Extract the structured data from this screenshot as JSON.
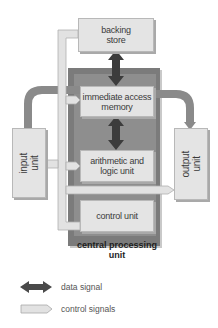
{
  "diagram": {
    "nodes": {
      "backing_store": "backing\nstore",
      "immediate_access_memory": "immediate access\nmemory",
      "arithmetic_logic_unit": "arithmetic and\nlogic unit",
      "control_unit": "control unit",
      "input_unit": "input\nunit",
      "output_unit": "output\nunit",
      "cpu": "central processing\nunit"
    },
    "labels": {
      "backing_store_l1": "backing",
      "backing_store_l2": "store",
      "iam_l1": "immediate access",
      "iam_l2": "memory",
      "alu_l1": "arithmetic and",
      "alu_l2": "logic unit",
      "control_unit": "control unit",
      "input_l1": "input",
      "input_l2": "unit",
      "output_l1": "output",
      "output_l2": "unit",
      "cpu_l1": "central processing",
      "cpu_l2": "unit"
    },
    "edges": [
      {
        "from": "backing_store",
        "to": "immediate_access_memory",
        "type": "data signal",
        "direction": "bidirectional"
      },
      {
        "from": "immediate_access_memory",
        "to": "arithmetic_logic_unit",
        "type": "data signal",
        "direction": "bidirectional"
      },
      {
        "from": "input_unit",
        "to": "immediate_access_memory",
        "type": "data flow"
      },
      {
        "from": "immediate_access_memory",
        "to": "output_unit",
        "type": "data flow"
      },
      {
        "from": "control_unit",
        "to": "backing_store",
        "type": "control signals"
      },
      {
        "from": "control_unit",
        "to": "immediate_access_memory",
        "type": "control signals"
      },
      {
        "from": "control_unit",
        "to": "arithmetic_logic_unit",
        "type": "control signals"
      },
      {
        "from": "control_unit",
        "to": "input_unit",
        "type": "control signals"
      },
      {
        "from": "control_unit",
        "to": "output_unit",
        "type": "control signals"
      }
    ],
    "legend": [
      {
        "symbol": "dark-double-arrow",
        "label": "data signal"
      },
      {
        "symbol": "light-arrow",
        "label": "control signals"
      }
    ],
    "colors": {
      "cpu_dark": "#7b7b7b",
      "box_fill": "#e4e4e4",
      "data_arrow": "#3c3c3c",
      "control_bus": "#dcdcdc",
      "flow_pipe": "#8a8a8a"
    }
  }
}
